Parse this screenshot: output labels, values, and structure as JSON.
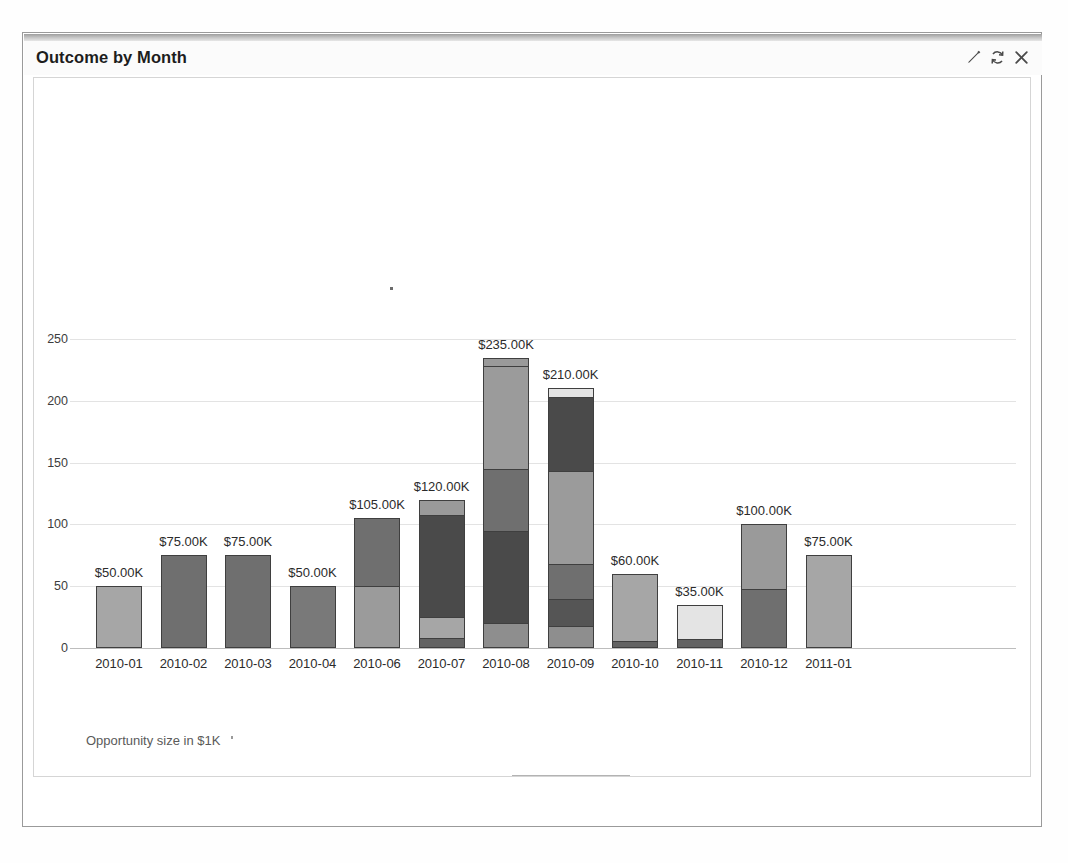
{
  "panel": {
    "title": "Outcome by Month",
    "icons": [
      {
        "name": "edit-icon",
        "glyph": "pencil"
      },
      {
        "name": "refresh-icon",
        "glyph": "refresh"
      },
      {
        "name": "close-icon",
        "glyph": "close"
      }
    ]
  },
  "footer_note": "Opportunity size in $1K",
  "legend": [
    {
      "label": "Prospecting",
      "color": "#6f6f6f"
    },
    {
      "label": "Qualification",
      "color": "#a6a6a6"
    },
    {
      "label": "Needs Analysis",
      "color": "#4a4a4a"
    },
    {
      "label": "Value Proposition",
      "color": "#797979"
    },
    {
      "label": "Id. Decision Makers",
      "color": "#9b9b9b"
    },
    {
      "label": "Perception Analysis",
      "color": "#555555"
    },
    {
      "label": "Proposal/Price Quote",
      "color": "#e4e4e4"
    },
    {
      "label": "Negotiation/Review",
      "color": "#8e8e8e"
    },
    {
      "label": "Closed Won",
      "color": "#636363"
    },
    {
      "label": "Closed Lost",
      "color": "#9a9a9a"
    }
  ],
  "chart_data": {
    "type": "bar",
    "stacked": true,
    "title": "Outcome by Month",
    "xlabel": "",
    "ylabel": "Opportunity size in $1K",
    "ylim": [
      0,
      250
    ],
    "yticks": [
      0,
      50,
      100,
      150,
      200,
      250
    ],
    "grid": true,
    "legend_position": "bottom",
    "categories": [
      "2010-01",
      "2010-02",
      "2010-03",
      "2010-04",
      "2010-06",
      "2010-07",
      "2010-08",
      "2010-09",
      "2010-10",
      "2010-11",
      "2010-12",
      "2011-01"
    ],
    "totals": [
      50,
      75,
      75,
      50,
      105,
      120,
      235,
      210,
      60,
      35,
      100,
      75
    ],
    "total_labels": [
      "$50.00K",
      "$75.00K",
      "$75.00K",
      "$50.00K",
      "$105.00K",
      "$120.00K",
      "$235.00K",
      "$210.00K",
      "$60.00K",
      "$35.00K",
      "$100.00K",
      "$75.00K"
    ],
    "bars": [
      {
        "category": "2010-01",
        "total": 50,
        "label": "$50.00K",
        "segments": [
          {
            "stage": "Qualification",
            "value": 50,
            "color": "#a6a6a6"
          }
        ]
      },
      {
        "category": "2010-02",
        "total": 75,
        "label": "$75.00K",
        "segments": [
          {
            "stage": "Prospecting",
            "value": 75,
            "color": "#6f6f6f"
          }
        ]
      },
      {
        "category": "2010-03",
        "total": 75,
        "label": "$75.00K",
        "segments": [
          {
            "stage": "Prospecting",
            "value": 75,
            "color": "#6f6f6f"
          }
        ]
      },
      {
        "category": "2010-04",
        "total": 50,
        "label": "$50.00K",
        "segments": [
          {
            "stage": "Value Proposition",
            "value": 50,
            "color": "#797979"
          }
        ]
      },
      {
        "category": "2010-06",
        "total": 105,
        "label": "$105.00K",
        "segments": [
          {
            "stage": "Id. Decision Makers",
            "value": 50,
            "color": "#9b9b9b"
          },
          {
            "stage": "Prospecting",
            "value": 55,
            "color": "#6f6f6f"
          }
        ]
      },
      {
        "category": "2010-07",
        "total": 120,
        "label": "$120.00K",
        "segments": [
          {
            "stage": "Closed Won",
            "value": 8,
            "color": "#636363"
          },
          {
            "stage": "Qualification",
            "value": 17,
            "color": "#a6a6a6"
          },
          {
            "stage": "Needs Analysis",
            "value": 83,
            "color": "#4a4a4a"
          },
          {
            "stage": "Closed Lost",
            "value": 12,
            "color": "#9a9a9a"
          }
        ]
      },
      {
        "category": "2010-08",
        "total": 235,
        "label": "$235.00K",
        "segments": [
          {
            "stage": "Negotiation/Review",
            "value": 20,
            "color": "#8e8e8e"
          },
          {
            "stage": "Needs Analysis",
            "value": 75,
            "color": "#4a4a4a"
          },
          {
            "stage": "Prospecting",
            "value": 50,
            "color": "#6f6f6f"
          },
          {
            "stage": "Id. Decision Makers",
            "value": 83,
            "color": "#9b9b9b"
          },
          {
            "stage": "Closed Lost",
            "value": 7,
            "color": "#9a9a9a"
          }
        ]
      },
      {
        "category": "2010-09",
        "total": 210,
        "label": "$210.00K",
        "segments": [
          {
            "stage": "Negotiation/Review",
            "value": 18,
            "color": "#8e8e8e"
          },
          {
            "stage": "Perception Analysis",
            "value": 22,
            "color": "#555555"
          },
          {
            "stage": "Prospecting",
            "value": 28,
            "color": "#6f6f6f"
          },
          {
            "stage": "Id. Decision Makers",
            "value": 75,
            "color": "#9b9b9b"
          },
          {
            "stage": "Needs Analysis",
            "value": 60,
            "color": "#4a4a4a"
          },
          {
            "stage": "Proposal/Price Quote",
            "value": 7,
            "color": "#e4e4e4"
          }
        ]
      },
      {
        "category": "2010-10",
        "total": 60,
        "label": "$60.00K",
        "segments": [
          {
            "stage": "Closed Won",
            "value": 6,
            "color": "#636363"
          },
          {
            "stage": "Qualification",
            "value": 54,
            "color": "#a6a6a6"
          }
        ]
      },
      {
        "category": "2010-11",
        "total": 35,
        "label": "$35.00K",
        "segments": [
          {
            "stage": "Closed Won",
            "value": 7,
            "color": "#636363"
          },
          {
            "stage": "Proposal/Price Quote",
            "value": 28,
            "color": "#e4e4e4"
          }
        ]
      },
      {
        "category": "2010-12",
        "total": 100,
        "label": "$100.00K",
        "segments": [
          {
            "stage": "Prospecting",
            "value": 48,
            "color": "#6f6f6f"
          },
          {
            "stage": "Closed Lost",
            "value": 52,
            "color": "#9a9a9a"
          }
        ]
      },
      {
        "category": "2011-01",
        "total": 75,
        "label": "$75.00K",
        "segments": [
          {
            "stage": "Qualification",
            "value": 75,
            "color": "#a6a6a6"
          }
        ]
      }
    ]
  }
}
